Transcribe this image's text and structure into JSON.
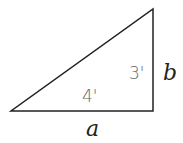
{
  "diagram": {
    "shape": "right-triangle",
    "vertices": {
      "left": [
        11,
        111
      ],
      "right_angle": [
        153,
        111
      ],
      "top": [
        153,
        9
      ]
    },
    "stroke_color": "#222222",
    "labels": {
      "vertical_side_value": "3'",
      "vertical_side_variable": "b",
      "horizontal_side_value": "4'",
      "horizontal_side_variable": "a"
    }
  }
}
